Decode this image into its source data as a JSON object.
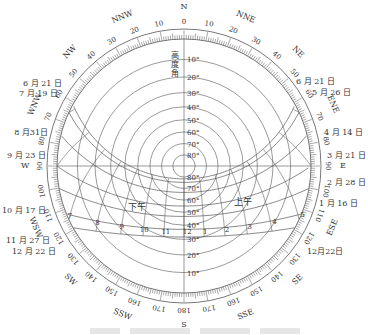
{
  "diagram": {
    "type": "sun-path-diagram",
    "center": [
      184,
      166
    ],
    "outer_radius": 137,
    "line_color": "#555555",
    "text_color": "#333333",
    "vertical_axis_label": "高度角",
    "altitude_circles": [
      10,
      20,
      30,
      40,
      50,
      60,
      70,
      80
    ],
    "altitude_labels_top": [
      "10°",
      "20°",
      "30°",
      "40°",
      "50°",
      "60°",
      "70°",
      "80°"
    ],
    "altitude_labels_bottom": [
      "80°",
      "70°",
      "60°",
      "50°",
      "40°",
      "30°",
      "20°",
      "10°"
    ],
    "azimuth_ticks": [
      0,
      10,
      20,
      30,
      40,
      50,
      60,
      70,
      80,
      90,
      100,
      110,
      120,
      130,
      140,
      150,
      160,
      170,
      180
    ],
    "compass_points": [
      {
        "label": "N",
        "az": 0
      },
      {
        "label": "NNE",
        "az": 22.5
      },
      {
        "label": "NE",
        "az": 45
      },
      {
        "label": "ENE",
        "az": 67.5
      },
      {
        "label": "E",
        "az": 90
      },
      {
        "label": "ESE",
        "az": 112.5
      },
      {
        "label": "SE",
        "az": 135
      },
      {
        "label": "SSE",
        "az": 157.5
      },
      {
        "label": "S",
        "az": 180
      },
      {
        "label": "SSW",
        "az": 202.5
      },
      {
        "label": "SW",
        "az": 225
      },
      {
        "label": "WSW",
        "az": 247.5
      },
      {
        "label": "W",
        "az": 270
      },
      {
        "label": "WNW",
        "az": 292.5
      },
      {
        "label": "NW",
        "az": 315
      },
      {
        "label": "NNW",
        "az": 337.5
      }
    ],
    "date_labels_right": [
      "6 月 21 日",
      "5 月 26 日",
      "4 月 14 日",
      "3 月 21 日",
      "2 月 28 日",
      "1 月 16 日",
      "12月22日"
    ],
    "date_labels_left": [
      "6 月 21 日",
      "7 月 19 日",
      "8 月31日",
      "9 月 23 日",
      "10 月 17 日",
      "11 月 27 日",
      "12 月 22 日"
    ],
    "hour_labels_morning": [
      "12",
      "11",
      "10",
      "9",
      "8",
      "7",
      "6",
      "5"
    ],
    "hour_labels_afternoon": [
      "1",
      "2",
      "3",
      "4",
      "5",
      "6",
      "7"
    ],
    "morning_label": "上午",
    "afternoon_label": "下午"
  }
}
